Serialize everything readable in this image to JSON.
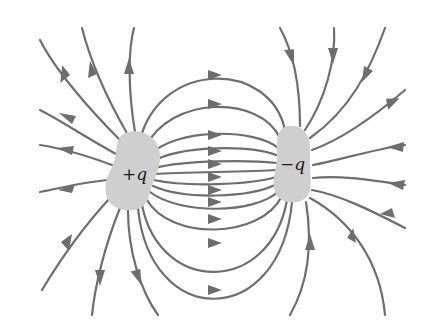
{
  "diagram": {
    "charges": [
      {
        "id": "positive",
        "label": "+q",
        "x": 135,
        "y": 175
      },
      {
        "id": "negative",
        "label": "−q",
        "x": 291,
        "y": 168
      }
    ],
    "colors": {
      "field_line": "#6e6e6e",
      "charge_fill": "#cfcfcf",
      "label": "#1a1a1a",
      "background": "#ffffff"
    },
    "field_direction": "from +q to −q"
  }
}
